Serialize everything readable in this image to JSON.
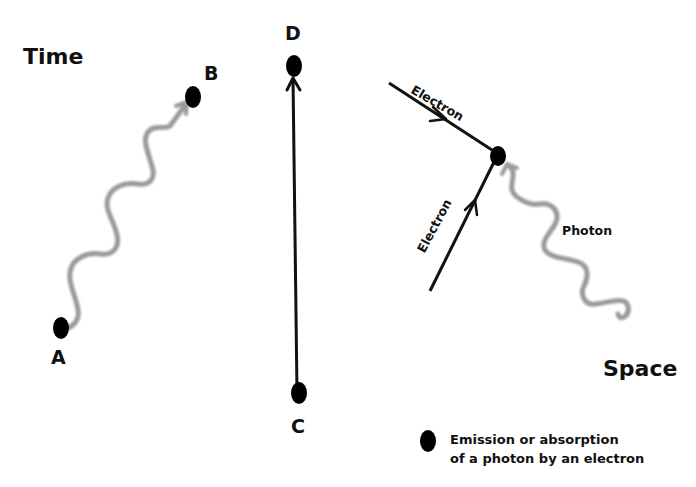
{
  "diagram": {
    "type": "spacetime-feynman-diagram",
    "axes": {
      "time_label": "Time",
      "space_label": "Space"
    },
    "points": {
      "A": "A",
      "B": "B",
      "C": "C",
      "D": "D"
    },
    "vertex_diagram": {
      "incoming_electron_1": "Electron",
      "incoming_electron_2": "Electron",
      "photon": "Photon"
    },
    "legend": {
      "line1": "Emission or absorption",
      "line2": "of a photon by an electron"
    },
    "colors": {
      "electron_line": "#111111",
      "photon_wave": "#9a9a9a",
      "event_dot": "#000000",
      "background": "#ffffff"
    }
  }
}
